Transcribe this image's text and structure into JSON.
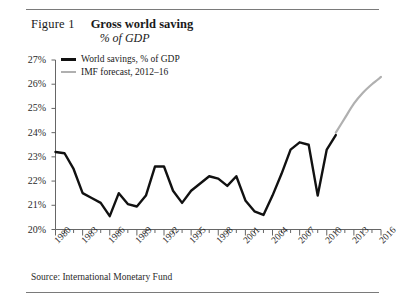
{
  "figure": {
    "number_label": "Figure 1",
    "title": "Gross world saving",
    "subtitle": "% of GDP",
    "source": "Source: International Monetary Fund"
  },
  "legend": {
    "position": "top-left-inside",
    "entries": [
      {
        "label": "World savings, % of GDP",
        "color": "#111111",
        "style": "solid-thick"
      },
      {
        "label": "IMF forecast, 2012–16",
        "color": "#b0b0b0",
        "style": "solid-thin"
      }
    ]
  },
  "chart_data": {
    "type": "line",
    "title": "Gross world saving",
    "subtitle": "% of GDP",
    "xlabel": "",
    "ylabel": "",
    "xlim": [
      1980,
      2016
    ],
    "ylim": [
      20,
      27
    ],
    "grid": false,
    "y_ticks": [
      20,
      21,
      22,
      23,
      24,
      25,
      26,
      27
    ],
    "y_tick_labels": [
      "20%",
      "21%",
      "22%",
      "23%",
      "24%",
      "25%",
      "26%",
      "27%"
    ],
    "x_ticks": [
      1980,
      1983,
      1986,
      1989,
      1992,
      1995,
      1998,
      2001,
      2004,
      2007,
      2010,
      2013,
      2016
    ],
    "x_tick_labels": [
      "1980",
      "1983",
      "1986",
      "1989",
      "1992",
      "1995",
      "1998",
      "2001",
      "2004",
      "2007",
      "2010",
      "2013",
      "2016"
    ],
    "x_minor_tick_step": 1,
    "series": [
      {
        "name": "World savings, % of GDP",
        "color": "#111111",
        "x": [
          1980,
          1981,
          1982,
          1983,
          1984,
          1985,
          1986,
          1987,
          1988,
          1989,
          1990,
          1991,
          1992,
          1993,
          1994,
          1995,
          1996,
          1997,
          1998,
          1999,
          2000,
          2001,
          2002,
          2003,
          2004,
          2005,
          2006,
          2007,
          2008,
          2009,
          2010,
          2011
        ],
        "values": [
          23.2,
          23.15,
          22.5,
          21.5,
          21.3,
          21.1,
          20.55,
          21.5,
          21.05,
          20.95,
          21.4,
          22.6,
          22.6,
          21.6,
          21.1,
          21.6,
          21.9,
          22.2,
          22.1,
          21.8,
          22.2,
          21.2,
          20.75,
          20.6,
          21.4,
          22.3,
          23.3,
          23.6,
          23.5,
          21.4,
          23.3,
          23.9
        ]
      },
      {
        "name": "IMF forecast, 2012–16",
        "color": "#b0b0b0",
        "x": [
          2011,
          2012,
          2013,
          2014,
          2015,
          2016
        ],
        "values": [
          24.0,
          24.6,
          25.2,
          25.65,
          26.0,
          26.3
        ]
      }
    ]
  }
}
